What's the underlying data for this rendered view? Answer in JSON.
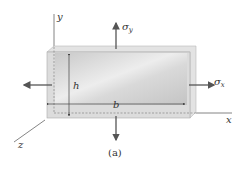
{
  "figure": {
    "caption": "(a)",
    "axes": {
      "x": "x",
      "y": "y",
      "z": "z"
    },
    "dimensions": {
      "height": "h",
      "width": "b"
    },
    "stresses": {
      "normal_x": "σx",
      "normal_y": "σy"
    },
    "colors": {
      "line": "#555555",
      "plate_light": "#f4f4f4",
      "plate_dark": "#bdbdbd",
      "edge": "#d8d8d8"
    }
  }
}
